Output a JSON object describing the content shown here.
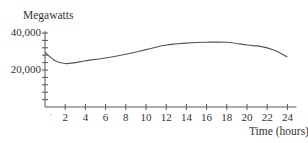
{
  "chart_data": {
    "type": "line",
    "title": "",
    "ylabel": "Megawatts",
    "xlabel": "Time (hours)",
    "xlim": [
      0,
      24
    ],
    "ylim": [
      0,
      40000
    ],
    "grid": false,
    "legend": "none",
    "x_ticks": [
      2,
      4,
      6,
      8,
      10,
      12,
      14,
      16,
      18,
      20,
      22,
      24
    ],
    "x_tick_labels": [
      "2",
      "4",
      "6",
      "8",
      "10",
      "12",
      "14",
      "16",
      "18",
      "20",
      "22",
      "24"
    ],
    "y_tick_labels": [
      {
        "value": 40000,
        "label": "40,000"
      },
      {
        "value": 20000,
        "label": "20,000"
      }
    ],
    "y_minor_tick_step": 4000,
    "series": [
      {
        "name": "Power consumption",
        "color": "#555555",
        "x": [
          0,
          1,
          2,
          3,
          4,
          6,
          8,
          10,
          12,
          14,
          16,
          18,
          20,
          21,
          22,
          23,
          24
        ],
        "values": [
          29500,
          25000,
          23500,
          24000,
          25000,
          26500,
          28500,
          31000,
          33500,
          34500,
          35000,
          35000,
          33500,
          33000,
          32000,
          30000,
          27000
        ]
      }
    ]
  },
  "labels": {
    "y_axis": "Megawatts",
    "x_axis": "Time (hours)",
    "y_40000": "40,000",
    "y_20000": "20,000",
    "origin_mark": "·"
  }
}
